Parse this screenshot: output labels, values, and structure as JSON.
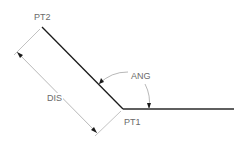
{
  "diagram": {
    "type": "geometry-angle-distance",
    "labels": {
      "pt1": "PT1",
      "pt2": "PT2",
      "distance": "DIS",
      "angle": "ANG"
    },
    "colors": {
      "object_line": "#1a1a1a",
      "dimension_line": "#9a9a9a",
      "text": "#6a6a6a",
      "background": "#ffffff"
    },
    "points": {
      "pt1": [
        123,
        109
      ],
      "pt2": [
        42,
        27
      ],
      "baseline_end": [
        234,
        109
      ]
    }
  }
}
